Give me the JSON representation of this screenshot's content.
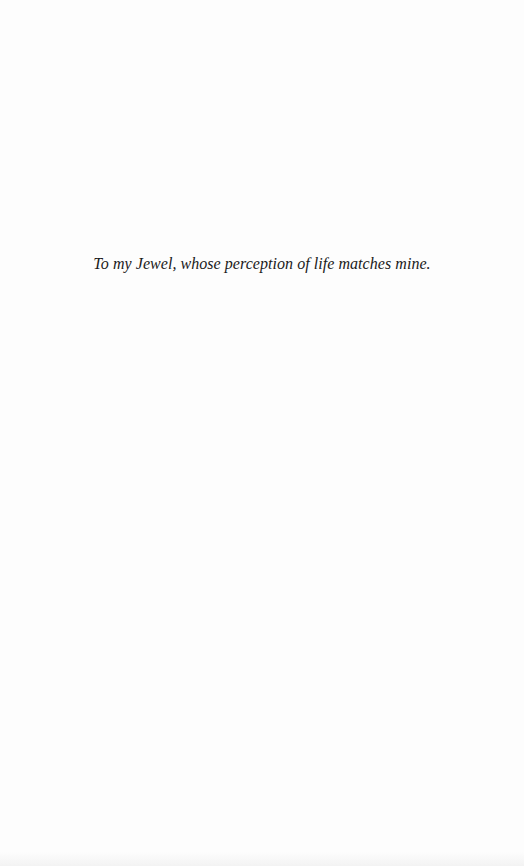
{
  "page": {
    "dedication": "To my Jewel, whose perception of life matches mine."
  }
}
